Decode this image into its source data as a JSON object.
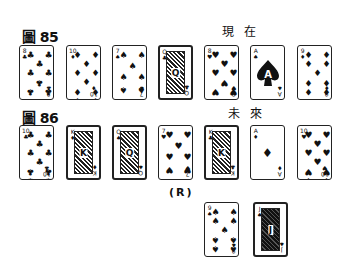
{
  "figure85": {
    "label": "圖 85",
    "time_label": "現在",
    "cards": [
      {
        "rank": "8",
        "suit": "♣",
        "name": "eight-of-clubs"
      },
      {
        "rank": "10",
        "suit": "♦",
        "name": "ten-of-diamonds"
      },
      {
        "rank": "7",
        "suit": "♠",
        "name": "seven-of-spades"
      },
      {
        "rank": "Q",
        "suit": "♣",
        "name": "queen-of-clubs",
        "face": true
      },
      {
        "rank": "8",
        "suit": "♥",
        "name": "eight-of-hearts"
      },
      {
        "rank": "A",
        "suit": "♠",
        "name": "ace-of-spades",
        "ace": true
      },
      {
        "rank": "9",
        "suit": "♦",
        "name": "nine-of-diamonds"
      }
    ]
  },
  "figure86": {
    "label": "圖 86",
    "time_label": "未來",
    "reversed_marker": "(R)",
    "cards": [
      {
        "rank": "10",
        "suit": "♣",
        "name": "ten-of-clubs"
      },
      {
        "rank": "K",
        "suit": "♦",
        "name": "king-of-diamonds",
        "face": true
      },
      {
        "rank": "Q",
        "suit": "♠",
        "name": "queen-of-spades",
        "face": true
      },
      {
        "rank": "7",
        "suit": "♥",
        "name": "seven-of-hearts"
      },
      {
        "rank": "K",
        "suit": "♣",
        "name": "king-of-clubs",
        "face": true
      },
      {
        "rank": "A",
        "suit": "♦",
        "name": "ace-of-diamonds",
        "ace": true
      },
      {
        "rank": "10",
        "suit": "♥",
        "name": "ten-of-hearts"
      }
    ],
    "extra_cards": [
      {
        "rank": "9",
        "suit": "♠",
        "name": "nine-of-spades"
      },
      {
        "rank": "J",
        "suit": "♠",
        "name": "jack-of-spades",
        "face": true,
        "dark": true
      }
    ]
  }
}
